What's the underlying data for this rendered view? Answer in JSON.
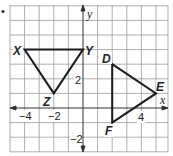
{
  "figure": {
    "bullet": "•",
    "grid": {
      "x_min": -5,
      "x_max": 5.8,
      "y_min": -3,
      "y_max": 7,
      "origin_px": [
        83,
        108
      ],
      "unit_px": 14.6,
      "line_color": "#9a9a9a",
      "axis_color": "#333333"
    },
    "axes": {
      "x_label": "x",
      "y_label": "y",
      "x_ticks": [
        {
          "value": -4,
          "label": "−4"
        },
        {
          "value": -2,
          "label": "−2"
        },
        {
          "value": 4,
          "label": "4"
        }
      ],
      "y_ticks": [
        {
          "value": 2,
          "label": "2"
        },
        {
          "value": -2,
          "label": "−2"
        }
      ]
    },
    "triangles": [
      {
        "name": "XYZ",
        "vertices": [
          {
            "label": "X",
            "x": -4,
            "y": 4
          },
          {
            "label": "Y",
            "x": 0,
            "y": 4
          },
          {
            "label": "Z",
            "x": -2,
            "y": 1
          }
        ]
      },
      {
        "name": "DEF",
        "vertices": [
          {
            "label": "D",
            "x": 2,
            "y": 3
          },
          {
            "label": "E",
            "x": 5,
            "y": 1
          },
          {
            "label": "F",
            "x": 2,
            "y": -1
          }
        ]
      }
    ],
    "stroke_color": "#1a1a1a"
  }
}
